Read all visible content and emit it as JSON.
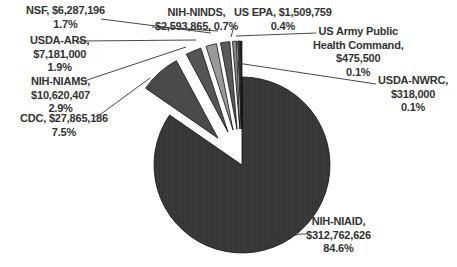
{
  "chart_data": {
    "type": "pie",
    "title": "",
    "exploded_group": [
      "CDC",
      "NIH-NIAMS",
      "USDA-ARS",
      "NSF",
      "NIH-NINDS",
      "US EPA",
      "US Army Public Health Command",
      "USDA-NWRC"
    ],
    "slices": [
      {
        "name": "NIH-NIAID",
        "value": 312762626,
        "value_label": "$312,762,626",
        "percent": 84.6,
        "percent_label": "84.6%",
        "color": "#3a3a3a"
      },
      {
        "name": "CDC",
        "value": 27865186,
        "value_label": "$27,865,186",
        "percent": 7.5,
        "percent_label": "7.5%",
        "color": "#4a4a4a"
      },
      {
        "name": "NIH-NIAMS",
        "value": 10620407,
        "value_label": "$10,620,407",
        "percent": 2.9,
        "percent_label": "2.9%",
        "color": "#555555"
      },
      {
        "name": "USDA-ARS",
        "value": 7181000,
        "value_label": "$7,181,000",
        "percent": 1.9,
        "percent_label": "1.9%",
        "color": "#9a9a9a"
      },
      {
        "name": "NSF",
        "value": 6287196,
        "value_label": "$6,287,196",
        "percent": 1.7,
        "percent_label": "1.7%",
        "color": "#5a5a5a"
      },
      {
        "name": "NIH-NINDS",
        "value": 2593865,
        "value_label": "$2,593,865",
        "percent": 0.7,
        "percent_label": "0.7%",
        "color": "#8a8a8a"
      },
      {
        "name": "US EPA",
        "value": 1509759,
        "value_label": "$1,509,759",
        "percent": 0.4,
        "percent_label": "0.4%",
        "color": "#444444"
      },
      {
        "name": "US Army Public Health Command",
        "value": 475500,
        "value_label": "$475,500",
        "percent": 0.1,
        "percent_label": "0.1%",
        "color": "#222222"
      },
      {
        "name": "USDA-NWRC",
        "value": 318000,
        "value_label": "$318,000",
        "percent": 0.1,
        "percent_label": "0.1%",
        "color": "#111111"
      }
    ],
    "legend": "none (data labels with leader lines)"
  },
  "labels": {
    "nsf": {
      "line1": "NSF, $6,287,196",
      "line2": "1.7%"
    },
    "usda_ars": {
      "line1": "USDA-ARS,",
      "line2": "$7,181,000",
      "line3": "1.9%"
    },
    "nih_niams": {
      "line1": "NIH-NIAMS,",
      "line2": "$10,620,407",
      "line3": "2.9%"
    },
    "cdc": {
      "line1": "CDC, $27,865,186",
      "line2": "7.5%"
    },
    "nih_ninds": {
      "line1": "NIH-NINDS,",
      "line2": "$2,593,865, 0.7%"
    },
    "us_epa": {
      "line1": "US EPA, $1,509,759",
      "line2": "0.4%"
    },
    "us_army": {
      "line1": "US Army Public",
      "line2": "Health Command,",
      "line3": "$475,500",
      "line4": "0.1%"
    },
    "usda_nwrc": {
      "line1": "USDA-NWRC,",
      "line2": "$318,000",
      "line3": "0.1%"
    },
    "nih_niaid": {
      "line1": "NIH-NIAID,",
      "line2": "$312,762,626",
      "line3": "84.6%"
    }
  }
}
